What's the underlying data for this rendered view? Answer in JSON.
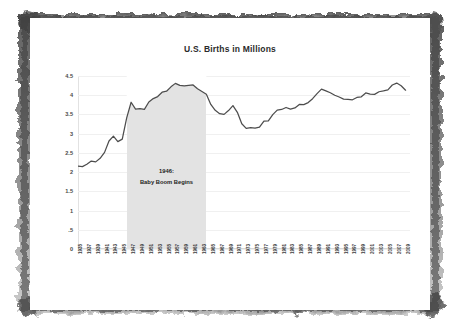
{
  "page": {
    "background_color": "#ffffff",
    "frame_style": "torn-charcoal-border"
  },
  "chart": {
    "title": "U.S. Births in Millions",
    "footnote": "Data Sources:  National Center for Health Statistics, and Author Calculations",
    "annotation_line1": "1946:",
    "annotation_line2": "Baby Boom Begins",
    "series_color": "#4d4d4d",
    "band_color": "#e3e3e3",
    "grid_color": "#f0f0f0"
  },
  "chart_data": {
    "type": "area",
    "title": "U.S. Births in Millions",
    "xlabel": "",
    "ylabel": "",
    "ylim": [
      0,
      4.5
    ],
    "xlim": [
      1935,
      2010
    ],
    "grid": true,
    "legend": false,
    "ytick_labels": [
      "0",
      ".5",
      "1",
      "1.5",
      "2",
      "2.5",
      "3",
      "3.5",
      "4",
      "4.5"
    ],
    "ytick_values": [
      0,
      0.5,
      1,
      1.5,
      2,
      2.5,
      3,
      3.5,
      4,
      4.5
    ],
    "xtick_labels": [
      "1935",
      "1937",
      "1939",
      "1941",
      "1943",
      "1945",
      "1947",
      "1949",
      "1951",
      "1953",
      "1955",
      "1957",
      "1959",
      "1961",
      "1963",
      "1965",
      "1967",
      "1969",
      "1971",
      "1973",
      "1975",
      "1977",
      "1979",
      "1981",
      "1983",
      "1985",
      "1987",
      "1989",
      "1991",
      "1993",
      "1995",
      "1997",
      "1999",
      "2001",
      "2003",
      "2005",
      "2007",
      "2009"
    ],
    "annotations": [
      {
        "text": "1946: Baby Boom Begins",
        "x_start": 1946,
        "x_end": 1964,
        "type": "shaded-band"
      }
    ],
    "x": [
      1935,
      1936,
      1937,
      1938,
      1939,
      1940,
      1941,
      1942,
      1943,
      1944,
      1945,
      1946,
      1947,
      1948,
      1949,
      1950,
      1951,
      1952,
      1953,
      1954,
      1955,
      1956,
      1957,
      1958,
      1959,
      1960,
      1961,
      1962,
      1963,
      1964,
      1965,
      1966,
      1967,
      1968,
      1969,
      1970,
      1971,
      1972,
      1973,
      1974,
      1975,
      1976,
      1977,
      1978,
      1979,
      1980,
      1981,
      1982,
      1983,
      1984,
      1985,
      1986,
      1987,
      1988,
      1989,
      1990,
      1991,
      1992,
      1993,
      1994,
      1995,
      1996,
      1997,
      1998,
      1999,
      2000,
      2001,
      2002,
      2003,
      2004,
      2005,
      2006,
      2007,
      2008,
      2009
    ],
    "values": [
      2.155,
      2.144,
      2.203,
      2.287,
      2.266,
      2.36,
      2.513,
      2.809,
      2.934,
      2.794,
      2.858,
      3.411,
      3.817,
      3.637,
      3.649,
      3.632,
      3.823,
      3.913,
      3.965,
      4.078,
      4.104,
      4.218,
      4.308,
      4.255,
      4.245,
      4.258,
      4.268,
      4.167,
      4.098,
      4.027,
      3.76,
      3.606,
      3.521,
      3.502,
      3.6,
      3.731,
      3.556,
      3.258,
      3.137,
      3.16,
      3.144,
      3.168,
      3.327,
      3.333,
      3.494,
      3.612,
      3.629,
      3.681,
      3.639,
      3.669,
      3.761,
      3.757,
      3.809,
      3.91,
      4.041,
      4.158,
      4.111,
      4.065,
      4.0,
      3.953,
      3.9,
      3.891,
      3.881,
      3.942,
      3.959,
      4.059,
      4.026,
      4.022,
      4.09,
      4.112,
      4.138,
      4.266,
      4.316,
      4.247,
      4.131
    ],
    "series_label": "U.S. Births (millions)"
  }
}
